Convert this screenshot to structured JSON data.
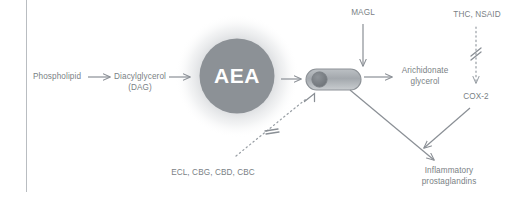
{
  "figure": {
    "background_color": "#ffffff",
    "frame_color": "#b9bdc1",
    "text_color": "#7a7f85",
    "node_fill_color": "#8c9196",
    "node_text_color": "#ffffff",
    "arrow_color": "#8a8f95",
    "dotted_line_color": "#9aa0a6"
  },
  "nodes": {
    "phospholipid": {
      "label": "Phospholipid"
    },
    "diacylglycerol": {
      "label": "Diacylglycerol\n(DAG)"
    },
    "aea": {
      "label": "AEA"
    },
    "membrane_enzyme": {
      "label": ""
    },
    "arachidonate": {
      "label": "Arichidonate\nglycerol"
    },
    "magl": {
      "label": "MAGL"
    },
    "thc_nsaid": {
      "label": "THC, NSAID"
    },
    "cox2": {
      "label": "COX-2"
    },
    "inflammatory": {
      "label": "Inflammatory\nprostaglandins"
    },
    "inhibitors": {
      "label": "ECL, CBG, CBD, CBC"
    }
  },
  "edges": [
    {
      "from": "phospholipid",
      "to": "diacylglycerol",
      "style": "solid-arrow"
    },
    {
      "from": "diacylglycerol",
      "to": "aea",
      "style": "solid-arrow"
    },
    {
      "from": "aea",
      "to": "membrane_enzyme",
      "style": "solid-arrow"
    },
    {
      "from": "magl",
      "to": "membrane_enzyme",
      "style": "solid-arrow"
    },
    {
      "from": "membrane_enzyme",
      "to": "arachidonate",
      "style": "solid-arrow"
    },
    {
      "from": "membrane_enzyme",
      "to": "inflammatory",
      "style": "solid-arrow"
    },
    {
      "from": "thc_nsaid",
      "to": "cox2",
      "style": "dotted-blocked-arrow"
    },
    {
      "from": "cox2",
      "to": "inflammatory",
      "style": "solid-arrow"
    },
    {
      "from": "inhibitors",
      "to": "membrane_enzyme",
      "style": "dotted-blocked-inhibition"
    }
  ]
}
